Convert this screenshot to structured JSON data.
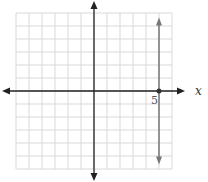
{
  "chart_data": {
    "type": "line",
    "title": "",
    "xlabel": "x",
    "ylabel": "",
    "xlim": [
      -6,
      6
    ],
    "ylim": [
      -6,
      6
    ],
    "grid": true,
    "grid_step": 1,
    "annotations": [
      {
        "text": "5",
        "x": 5,
        "y": 0
      }
    ],
    "series": [
      {
        "name": "vertical line x = 5",
        "kind": "vertical-line",
        "x": 5,
        "y_range": [
          -5.5,
          5.5
        ],
        "arrows": "both",
        "color": "#777777"
      }
    ],
    "points": [
      {
        "x": 5,
        "y": 0,
        "color": "#333333"
      }
    ],
    "colors": {
      "grid": "#d9d9d9",
      "axes": "#222222",
      "line": "#777777"
    }
  }
}
